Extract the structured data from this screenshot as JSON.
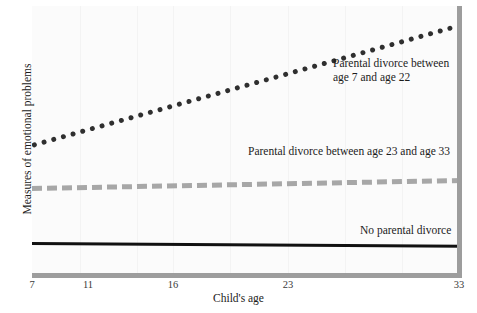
{
  "chart_data": {
    "type": "line",
    "title": "",
    "subtitle": "",
    "xlabel": "Child's age",
    "ylabel": "Measures of emotional problems",
    "xlim": [
      7,
      33
    ],
    "ylim": [
      0,
      1
    ],
    "xticks": [
      "7",
      "11",
      "16",
      "23",
      "33"
    ],
    "xtick_values": [
      7,
      11,
      16,
      23,
      33
    ],
    "yticks": [],
    "grid": "faint-vertical",
    "legend_position": "inline-annotations",
    "series": [
      {
        "name": "Parental divorce between age 7 and age 22",
        "style": "dotted",
        "color": "#2f2f2f",
        "x": [
          7,
          33
        ],
        "values": [
          0.49,
          0.94
        ],
        "annotation": "Parental divorce between\nage 7 and age 22"
      },
      {
        "name": "Parental divorce between age 23 and age 33",
        "style": "dashed",
        "color": "#a7a7a7",
        "x": [
          7,
          33
        ],
        "values": [
          0.33,
          0.36
        ],
        "annotation": "Parental divorce between age 23 and age 33"
      },
      {
        "name": "No parental divorce",
        "style": "solid",
        "color": "#111111",
        "x": [
          7,
          33
        ],
        "values": [
          0.12,
          0.11
        ],
        "annotation": "No parental divorce"
      }
    ]
  },
  "axes": {
    "x_title": "Child's age",
    "y_title": "Measures of emotional problems",
    "tick_labels": [
      "7",
      "11",
      "16",
      "23",
      "33"
    ],
    "axis_color": "#9d9d9d"
  },
  "annotations": {
    "divorce_7_22": "Parental divorce between\nage 7 and age 22",
    "divorce_23_33": "Parental divorce between age 23 and age 33",
    "no_divorce": "No parental divorce"
  }
}
